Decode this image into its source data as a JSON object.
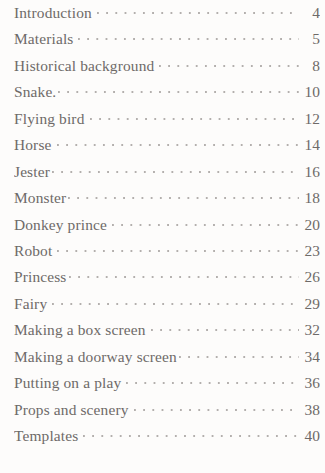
{
  "document": {
    "type": "table-of-contents",
    "background_color": "#fdfcfb",
    "text_color": "#6e6a68",
    "leader_color": "#b3afad"
  },
  "toc": {
    "entries": [
      {
        "title": "Introduction",
        "page": "4",
        "tight": false
      },
      {
        "title": "Materials",
        "page": "5",
        "tight": false
      },
      {
        "title": "Historical background",
        "page": "8",
        "tight": false
      },
      {
        "title": "Snake.",
        "page": "10",
        "tight": true
      },
      {
        "title": "Flying bird",
        "page": "12",
        "tight": false
      },
      {
        "title": "Horse",
        "page": "14",
        "tight": false
      },
      {
        "title": "Jester",
        "page": "16",
        "tight": true
      },
      {
        "title": "Monster",
        "page": "18",
        "tight": true
      },
      {
        "title": "Donkey prince",
        "page": "20",
        "tight": false
      },
      {
        "title": "Robot",
        "page": "23",
        "tight": false
      },
      {
        "title": "Princess",
        "page": "26",
        "tight": true
      },
      {
        "title": "Fairy",
        "page": "29",
        "tight": false
      },
      {
        "title": "Making a box screen",
        "page": "32",
        "tight": false
      },
      {
        "title": "Making a doorway screen",
        "page": "34",
        "tight": true
      },
      {
        "title": "Putting on a play",
        "page": "36",
        "tight": false
      },
      {
        "title": "Props and scenery",
        "page": "38",
        "tight": false
      },
      {
        "title": "Templates",
        "page": "40",
        "tight": false
      }
    ]
  }
}
